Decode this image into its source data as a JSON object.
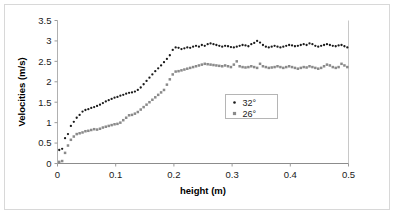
{
  "chart_data": {
    "type": "scatter",
    "title": "",
    "xlabel": "height (m)",
    "ylabel": "Velocities (m/s)",
    "xlim": [
      0,
      0.5
    ],
    "ylim": [
      0,
      3.5
    ],
    "xticks": [
      "0",
      "0.1",
      "0.2",
      "0.3",
      "0.4",
      "0.5"
    ],
    "xtick_values": [
      0,
      0.1,
      0.2,
      0.3,
      0.4,
      0.5
    ],
    "yticks": [
      "0",
      "0.5",
      "1",
      "1.5",
      "2",
      "2.5",
      "3",
      "3.5"
    ],
    "ytick_values": [
      0,
      0.5,
      1,
      1.5,
      2,
      2.5,
      3,
      3.5
    ],
    "grid": false,
    "legend_position": "inside lower-right",
    "series": [
      {
        "name": "32°",
        "marker": "dot",
        "color": "#1a1a1a",
        "x": [
          0.003,
          0.008,
          0.013,
          0.018,
          0.023,
          0.028,
          0.033,
          0.038,
          0.043,
          0.048,
          0.053,
          0.058,
          0.063,
          0.068,
          0.073,
          0.078,
          0.083,
          0.088,
          0.093,
          0.098,
          0.103,
          0.108,
          0.113,
          0.118,
          0.123,
          0.128,
          0.133,
          0.138,
          0.143,
          0.148,
          0.153,
          0.158,
          0.163,
          0.168,
          0.173,
          0.178,
          0.183,
          0.188,
          0.193,
          0.198,
          0.203,
          0.208,
          0.213,
          0.218,
          0.223,
          0.228,
          0.233,
          0.238,
          0.243,
          0.248,
          0.253,
          0.258,
          0.263,
          0.268,
          0.273,
          0.278,
          0.283,
          0.288,
          0.293,
          0.298,
          0.303,
          0.308,
          0.313,
          0.318,
          0.323,
          0.328,
          0.333,
          0.338,
          0.343,
          0.348,
          0.353,
          0.358,
          0.363,
          0.368,
          0.373,
          0.378,
          0.383,
          0.388,
          0.393,
          0.398,
          0.403,
          0.408,
          0.413,
          0.418,
          0.423,
          0.428,
          0.433,
          0.438,
          0.443,
          0.448,
          0.453,
          0.458,
          0.463,
          0.468,
          0.473,
          0.478,
          0.483,
          0.488,
          0.493,
          0.498
        ],
        "y": [
          0.33,
          0.36,
          0.62,
          0.72,
          0.92,
          1.02,
          1.12,
          1.19,
          1.27,
          1.31,
          1.33,
          1.36,
          1.38,
          1.41,
          1.44,
          1.48,
          1.52,
          1.55,
          1.58,
          1.61,
          1.63,
          1.66,
          1.68,
          1.71,
          1.73,
          1.74,
          1.76,
          1.8,
          1.86,
          1.94,
          2.02,
          2.1,
          2.18,
          2.26,
          2.33,
          2.4,
          2.48,
          2.56,
          2.65,
          2.78,
          2.84,
          2.83,
          2.8,
          2.82,
          2.84,
          2.83,
          2.86,
          2.88,
          2.86,
          2.9,
          2.88,
          2.92,
          2.94,
          2.92,
          2.9,
          2.88,
          2.86,
          2.88,
          2.87,
          2.85,
          2.84,
          2.86,
          2.88,
          2.9,
          2.89,
          2.87,
          2.92,
          2.95,
          3.0,
          2.96,
          2.9,
          2.86,
          2.84,
          2.86,
          2.88,
          2.86,
          2.84,
          2.86,
          2.88,
          2.9,
          2.89,
          2.87,
          2.88,
          2.9,
          2.92,
          2.9,
          2.94,
          2.92,
          2.88,
          2.86,
          2.88,
          2.9,
          2.92,
          2.9,
          2.88,
          2.87,
          2.89,
          2.9,
          2.87,
          2.84
        ]
      },
      {
        "name": "26°",
        "marker": "square",
        "color": "#8a8a8a",
        "x": [
          0.003,
          0.008,
          0.013,
          0.018,
          0.023,
          0.028,
          0.033,
          0.038,
          0.043,
          0.048,
          0.053,
          0.058,
          0.063,
          0.068,
          0.073,
          0.078,
          0.083,
          0.088,
          0.093,
          0.098,
          0.103,
          0.108,
          0.113,
          0.118,
          0.123,
          0.128,
          0.133,
          0.138,
          0.143,
          0.148,
          0.153,
          0.158,
          0.163,
          0.168,
          0.173,
          0.178,
          0.183,
          0.188,
          0.193,
          0.198,
          0.203,
          0.208,
          0.213,
          0.218,
          0.223,
          0.228,
          0.233,
          0.238,
          0.243,
          0.248,
          0.253,
          0.258,
          0.263,
          0.268,
          0.273,
          0.278,
          0.283,
          0.288,
          0.293,
          0.298,
          0.303,
          0.308,
          0.313,
          0.318,
          0.323,
          0.328,
          0.333,
          0.338,
          0.343,
          0.348,
          0.353,
          0.358,
          0.363,
          0.368,
          0.373,
          0.378,
          0.383,
          0.388,
          0.393,
          0.398,
          0.403,
          0.408,
          0.413,
          0.418,
          0.423,
          0.428,
          0.433,
          0.438,
          0.443,
          0.448,
          0.453,
          0.458,
          0.463,
          0.468,
          0.473,
          0.478,
          0.483,
          0.488,
          0.493,
          0.498
        ],
        "y": [
          0.04,
          0.06,
          0.26,
          0.44,
          0.58,
          0.66,
          0.72,
          0.74,
          0.76,
          0.79,
          0.8,
          0.82,
          0.84,
          0.83,
          0.85,
          0.88,
          0.9,
          0.92,
          0.94,
          0.96,
          0.97,
          1.0,
          1.06,
          1.12,
          1.18,
          1.19,
          1.22,
          1.26,
          1.32,
          1.38,
          1.44,
          1.5,
          1.56,
          1.62,
          1.68,
          1.74,
          1.8,
          1.93,
          2.06,
          2.18,
          2.25,
          2.26,
          2.28,
          2.3,
          2.32,
          2.34,
          2.36,
          2.38,
          2.4,
          2.42,
          2.44,
          2.43,
          2.42,
          2.41,
          2.4,
          2.39,
          2.38,
          2.4,
          2.38,
          2.36,
          2.42,
          2.5,
          2.38,
          2.36,
          2.35,
          2.36,
          2.38,
          2.36,
          2.34,
          2.44,
          2.38,
          2.36,
          2.34,
          2.35,
          2.36,
          2.38,
          2.36,
          2.34,
          2.36,
          2.38,
          2.36,
          2.34,
          2.32,
          2.34,
          2.36,
          2.35,
          2.38,
          2.36,
          2.34,
          2.32,
          2.34,
          2.38,
          2.42,
          2.4,
          2.36,
          2.34,
          2.36,
          2.44,
          2.4,
          2.36
        ]
      }
    ],
    "legend": [
      {
        "label": "32°",
        "marker": "dot",
        "color": "#1a1a1a"
      },
      {
        "label": "26°",
        "marker": "square",
        "color": "#8a8a8a"
      }
    ]
  }
}
